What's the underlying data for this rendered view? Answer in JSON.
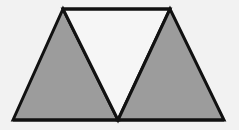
{
  "diagram": {
    "colors": {
      "background": "#f2f2f2",
      "shaded_fill": "#9c9c9c",
      "unshaded_fill": "#f6f6f6",
      "stroke": "#111111"
    },
    "stroke_width": 3,
    "vertices": {
      "top_left": [
        63,
        9
      ],
      "top_right": [
        170,
        9
      ],
      "bottom_left": [
        13,
        120
      ],
      "bottom_middle": [
        118,
        120
      ],
      "bottom_right": [
        224,
        120
      ]
    },
    "shapes": [
      {
        "name": "left-shaded-triangle",
        "points": "13,120 63,9 118,120",
        "fill_key": "shaded_fill"
      },
      {
        "name": "middle-unshaded-triangle",
        "points": "63,9 170,9 118,120",
        "fill_key": "unshaded_fill"
      },
      {
        "name": "right-shaded-triangle",
        "points": "118,120 170,9 224,120",
        "fill_key": "shaded_fill"
      }
    ]
  }
}
